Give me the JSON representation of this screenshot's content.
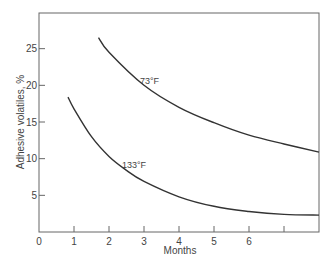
{
  "chart_data": {
    "type": "line",
    "title": "",
    "xlabel": "Months",
    "ylabel": "Adhesive volatiles, %",
    "xlim": [
      0,
      8
    ],
    "ylim": [
      0,
      30
    ],
    "x_ticks": [
      0,
      1,
      2,
      3,
      4,
      5,
      6,
      7
    ],
    "x_tick_labels": [
      "0",
      "1",
      "2",
      "3",
      "4",
      "5",
      "6",
      ""
    ],
    "y_ticks": [
      5,
      10,
      15,
      20,
      25
    ],
    "y_tick_labels": [
      "5",
      "10",
      "15",
      "20",
      "25"
    ],
    "grid": false,
    "legend": "none (curves labeled inline)",
    "series": [
      {
        "name": "73°F",
        "label": "73°F",
        "x": [
          1.7,
          2,
          3,
          4,
          5,
          6,
          7,
          8
        ],
        "y": [
          26.5,
          24.5,
          20,
          17,
          14.9,
          13.2,
          12,
          10.9
        ]
      },
      {
        "name": "133°F",
        "label": "133°F",
        "x": [
          0.83,
          1,
          1.5,
          2,
          2.5,
          3,
          4,
          5,
          6,
          7,
          8
        ],
        "y": [
          18.4,
          16.8,
          13,
          10.3,
          8.4,
          6.9,
          4.8,
          3.5,
          2.8,
          2.4,
          2.3
        ]
      }
    ]
  },
  "colors": {
    "line": "#333333",
    "axis": "#555555",
    "text": "#444444",
    "background": "#ffffff"
  }
}
